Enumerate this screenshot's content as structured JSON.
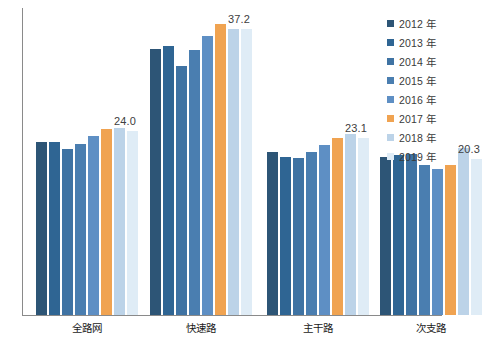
{
  "chart_data": {
    "type": "bar",
    "title": "",
    "subtitle": "",
    "xlabel": "",
    "ylabel": "",
    "grid": false,
    "legend_position": "right",
    "ylim": [
      0,
      40
    ],
    "categories": [
      "全路网",
      "快速路",
      "主干路",
      "次支路"
    ],
    "series": [
      {
        "name": "2012 年",
        "color": "#2d5576",
        "values": [
          22.6,
          34.6,
          21.3,
          20.6
        ]
      },
      {
        "name": "2013 年",
        "color": "#2f6593",
        "values": [
          22.5,
          35.0,
          20.6,
          20.8
        ]
      },
      {
        "name": "2014 年",
        "color": "#3f73a3",
        "values": [
          21.6,
          32.5,
          20.4,
          21.0
        ]
      },
      {
        "name": "2015 年",
        "color": "#4a7eb0",
        "values": [
          22.3,
          34.5,
          21.3,
          19.6
        ]
      },
      {
        "name": "2016 年",
        "color": "#5e8fc4",
        "values": [
          23.3,
          36.4,
          22.1,
          19.0
        ]
      },
      {
        "name": "2017 年",
        "color": "#f0a351",
        "values": [
          24.2,
          37.9,
          23.1,
          19.5
        ]
      },
      {
        "name": "2018 年",
        "color": "#bcd3e8",
        "values": [
          24.4,
          37.3,
          23.6,
          21.7
        ]
      },
      {
        "name": "2019 年",
        "color": "#dfecf6",
        "values": [
          24.0,
          37.2,
          23.1,
          20.3
        ]
      }
    ],
    "data_labels": [
      {
        "category": "全路网",
        "series": "2019 年",
        "text": "24.0"
      },
      {
        "category": "快速路",
        "series": "2019 年",
        "text": "37.2"
      },
      {
        "category": "主干路",
        "series": "2019 年",
        "text": "23.1"
      },
      {
        "category": "次支路",
        "series": "2019 年",
        "text": "20.3"
      }
    ]
  },
  "legend": {
    "items": [
      {
        "label": "2012 年",
        "color": "#2d5576"
      },
      {
        "label": "2013 年",
        "color": "#2f6593"
      },
      {
        "label": "2014 年",
        "color": "#3f73a3"
      },
      {
        "label": "2015 年",
        "color": "#4a7eb0"
      },
      {
        "label": "2016 年",
        "color": "#5e8fc4"
      },
      {
        "label": "2017 年",
        "color": "#f0a351"
      },
      {
        "label": "2018 年",
        "color": "#bcd3e8"
      },
      {
        "label": "2019 年",
        "color": "#dfecf6"
      }
    ]
  },
  "axis": {
    "color": "#8a8a8a"
  }
}
